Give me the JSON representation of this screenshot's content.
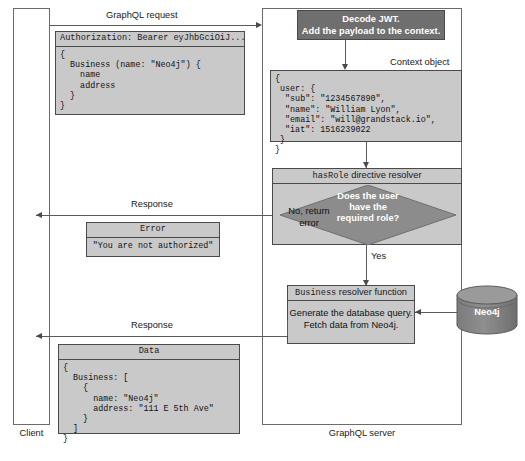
{
  "diagram": {
    "lanes": [
      {
        "name": "client",
        "label": "Client"
      },
      {
        "name": "graphql-server",
        "label": "GraphQL server"
      }
    ],
    "edges": {
      "request": "GraphQL request",
      "response_error": "Response",
      "response_data": "Response",
      "no_branch": "No, return\nerror",
      "no_branch_line1": "No, return",
      "no_branch_line2": "error",
      "yes_branch": "Yes"
    },
    "request_box": {
      "header": "Authorization: Bearer eyJhbGciOiJ...",
      "body": "{\n  Business (name: \"Neo4j\") {\n    name\n    address\n  }\n}"
    },
    "decode_box": {
      "line1": "Decode JWT.",
      "line2": "Add the payload to the context."
    },
    "context_object": {
      "label": "Context object",
      "body": "{\n user: {\n  \"sub\": \"1234567890\",\n  \"name\": \"William Lyon\",\n  \"email\": \"will@grandstack.io\",\n  \"iat\": 1516239022\n }\n}"
    },
    "has_role_box": {
      "header_mono": "hasRole",
      "header_rest": " directive resolver",
      "decision_line1": "Does the user",
      "decision_line2": "have the",
      "decision_line3": "required role?"
    },
    "error_box": {
      "header": "Error",
      "body": "\"You are not authorized\""
    },
    "resolver_box": {
      "header_mono": "Business",
      "header_rest": " resolver function",
      "line1": "Generate the database query.",
      "line2": "Fetch data from Neo4j."
    },
    "database": {
      "label": "Neo4j"
    },
    "data_box": {
      "header": "Data",
      "body": "{\n  Business: [\n    {\n      name: \"Neo4j\"\n      address: \"111 E 5th Ave\"\n    }\n  ]\n}"
    },
    "colors": {
      "box_fill": "#c9c9c9",
      "dark_fill": "#6f6f6f",
      "diamond_fill": "#8c8c8c",
      "stroke": "#4a4a4a",
      "line": "#5a5a5a",
      "text": "#111111",
      "text_inverse": "#ffffff"
    }
  }
}
